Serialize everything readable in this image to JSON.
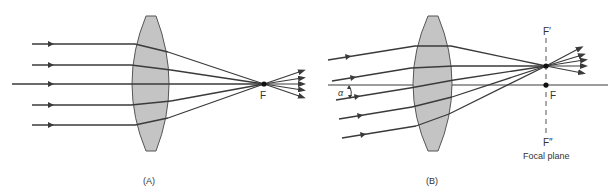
{
  "diagram": {
    "colors": {
      "lens_fill": "#c4c4c4",
      "lens_stroke": "#555555",
      "ray": "#3a3a3a",
      "background": "#ffffff"
    },
    "panel_a": {
      "caption": "(A)",
      "focal_label": "F",
      "description": "Parallel rays along optical axis converge at focal point F"
    },
    "panel_b": {
      "caption": "(B)",
      "focal_label": "F",
      "upper_label": "F′",
      "lower_label": "F″",
      "angle_label": "α",
      "focal_plane_label": "Focal plane",
      "description": "Oblique parallel rays at angle α converge at point F′ on the focal plane"
    }
  }
}
